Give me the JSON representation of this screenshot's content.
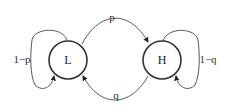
{
  "diagram": {
    "type": "state-transition",
    "nodes": [
      {
        "id": "L",
        "label": "L"
      },
      {
        "id": "H",
        "label": "H"
      }
    ],
    "edges": [
      {
        "from": "L",
        "to": "H",
        "label": "p"
      },
      {
        "from": "H",
        "to": "L",
        "label": "q"
      },
      {
        "from": "L",
        "to": "L",
        "label": "1−p"
      },
      {
        "from": "H",
        "to": "H",
        "label": "1−q"
      }
    ]
  }
}
